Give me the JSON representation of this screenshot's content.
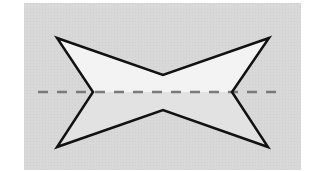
{
  "diagram": {
    "type": "symmetry-figure",
    "panel": {
      "x": 24,
      "y": 3,
      "width": 277,
      "height": 167,
      "fill": "#d8d8d8",
      "texture_fill": "#cfcfcf"
    },
    "shape": {
      "name": "bowtie-polygon",
      "vertices": [
        {
          "label": "top-left",
          "x": 57,
          "y": 38
        },
        {
          "label": "top-notch",
          "x": 163,
          "y": 75
        },
        {
          "label": "top-right",
          "x": 269,
          "y": 38
        },
        {
          "label": "right-inner",
          "x": 232,
          "y": 92
        },
        {
          "label": "bottom-right",
          "x": 268,
          "y": 147
        },
        {
          "label": "bottom-notch",
          "x": 163,
          "y": 110
        },
        {
          "label": "bottom-left",
          "x": 57,
          "y": 147
        },
        {
          "label": "left-inner",
          "x": 93,
          "y": 92
        }
      ],
      "upper_fill": "#f3f3f3",
      "lower_fill": "#e2e2e2",
      "stroke": "#111111",
      "stroke_width": 2.5
    },
    "symmetry_line": {
      "orientation": "horizontal",
      "x1": 38,
      "y1": 92,
      "x2": 285,
      "y2": 92,
      "color": "#7a7a7a",
      "dash": "10 9",
      "stroke_width": 2.5
    }
  }
}
